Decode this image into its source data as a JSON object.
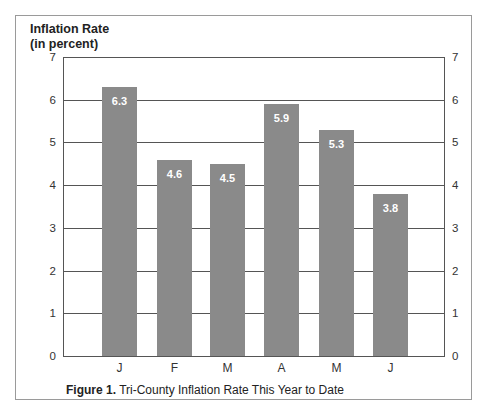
{
  "chart_data": {
    "type": "bar",
    "title": "Tri-County Inflation Rate This Year to Date",
    "figure_label": "Figure 1.",
    "ylabel": "Inflation Rate (in percent)",
    "ylabel_lines": [
      "Inflation Rate",
      "(in percent)"
    ],
    "xlabel": "",
    "categories": [
      "J",
      "F",
      "M",
      "A",
      "M",
      "J"
    ],
    "values": [
      6.3,
      4.6,
      4.5,
      5.9,
      5.3,
      3.8
    ],
    "data_labels": [
      "6.3",
      "4.6",
      "4.5",
      "5.9",
      "5.3",
      "3.8"
    ],
    "ylim": [
      0,
      7
    ],
    "yticks": [
      0,
      1,
      2,
      3,
      4,
      5,
      6,
      7
    ],
    "grid": true,
    "y_axis_mirrored_right": true,
    "bar_color": "#8a8a8a",
    "label_color": "#ffffff"
  },
  "caption": {
    "label": "Figure 1.",
    "text": " Tri-County Inflation Rate This Year to Date"
  }
}
